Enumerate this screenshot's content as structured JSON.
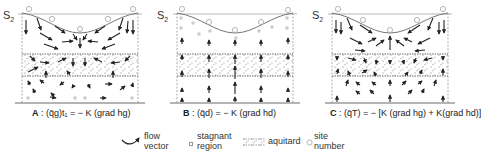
{
  "figure": {
    "surface_label": "S",
    "surface_sub": "2",
    "panels": [
      {
        "id": "A",
        "letter": "A",
        "equation": ": (q̄g)t₁ = − K (grad hg)"
      },
      {
        "id": "B",
        "letter": "B",
        "equation": ": (q̄d) = − K (grad hd)"
      },
      {
        "id": "C",
        "letter": "C",
        "equation": ": (q̄T) = − [K (grad hg) + K(grad hd)]"
      }
    ],
    "site_numbers": [
      "1",
      "2",
      "3",
      "2",
      "1"
    ]
  },
  "legend": {
    "flow_vector_1": "flow",
    "flow_vector_2": "vector",
    "stagnant_1": "stagnant",
    "stagnant_2": "region",
    "aquitard": "aquitard",
    "site_1": "site",
    "site_2": "number"
  },
  "colors": {
    "line": "#333333",
    "curve": "#777777",
    "dots": "#999999"
  }
}
